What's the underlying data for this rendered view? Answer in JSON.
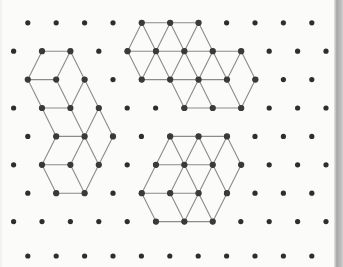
{
  "canvas": {
    "width": 343,
    "height": 267,
    "background_color": "#fbfbfa",
    "title": "isometric-cube-puzzle-dot-grid"
  },
  "grid": {
    "type": "triangular-dot-lattice",
    "dot_color": "#2e2e2e",
    "dot_radius": 2.6,
    "column_spacing": 28.4,
    "row_spacing": 28.4,
    "odd_row_offset": 14.2,
    "origin_x": 13.6,
    "origin_y": 22.8,
    "columns": 12,
    "rows": 9,
    "row_y_values": [
      22.8,
      51.2,
      79.6,
      108.0,
      136.4,
      164.8,
      193.2,
      221.6,
      256.0
    ],
    "row_offsets": [
      1,
      0,
      1,
      0,
      1,
      0,
      1,
      0,
      1
    ]
  },
  "style": {
    "line_color": "#8b8b8b",
    "line_width": 1.1,
    "vertex_color": "#3a3a3a",
    "vertex_radius": 3.1,
    "edge_strip_color": "#a8a8a8"
  },
  "chart_data": {
    "type": "scatter",
    "xlabel": "",
    "ylabel": "",
    "xlim": [
      0,
      343
    ],
    "ylim": [
      0,
      267
    ],
    "grid": true,
    "legend": "none",
    "shapes": [
      {
        "name": "left-cube-cluster",
        "label": "left shape",
        "vertices": [
          [
            42.0,
            51.2
          ],
          [
            70.4,
            51.2
          ],
          [
            27.8,
            79.6
          ],
          [
            56.2,
            79.6
          ],
          [
            84.6,
            79.6
          ],
          [
            42.0,
            108.0
          ],
          [
            70.4,
            108.0
          ],
          [
            98.8,
            108.0
          ],
          [
            56.2,
            136.4
          ],
          [
            84.6,
            136.4
          ],
          [
            113.0,
            136.4
          ],
          [
            42.0,
            164.8
          ],
          [
            70.4,
            164.8
          ],
          [
            98.8,
            164.8
          ],
          [
            56.2,
            193.2
          ],
          [
            84.6,
            193.2
          ]
        ],
        "edges": [
          [
            [
              42.0,
              51.2
            ],
            [
              70.4,
              51.2
            ]
          ],
          [
            [
              42.0,
              51.2
            ],
            [
              27.8,
              79.6
            ]
          ],
          [
            [
              70.4,
              51.2
            ],
            [
              56.2,
              79.6
            ]
          ],
          [
            [
              70.4,
              51.2
            ],
            [
              84.6,
              79.6
            ]
          ],
          [
            [
              27.8,
              79.6
            ],
            [
              56.2,
              79.6
            ]
          ],
          [
            [
              27.8,
              79.6
            ],
            [
              42.0,
              108.0
            ]
          ],
          [
            [
              56.2,
              79.6
            ],
            [
              70.4,
              108.0
            ]
          ],
          [
            [
              84.6,
              79.6
            ],
            [
              70.4,
              108.0
            ]
          ],
          [
            [
              84.6,
              79.6
            ],
            [
              98.8,
              108.0
            ]
          ],
          [
            [
              42.0,
              108.0
            ],
            [
              70.4,
              108.0
            ]
          ],
          [
            [
              42.0,
              108.0
            ],
            [
              56.2,
              136.4
            ]
          ],
          [
            [
              70.4,
              108.0
            ],
            [
              84.6,
              136.4
            ]
          ],
          [
            [
              98.8,
              108.0
            ],
            [
              84.6,
              136.4
            ]
          ],
          [
            [
              98.8,
              108.0
            ],
            [
              113.0,
              136.4
            ]
          ],
          [
            [
              56.2,
              136.4
            ],
            [
              84.6,
              136.4
            ]
          ],
          [
            [
              56.2,
              136.4
            ],
            [
              42.0,
              164.8
            ]
          ],
          [
            [
              84.6,
              136.4
            ],
            [
              70.4,
              164.8
            ]
          ],
          [
            [
              84.6,
              136.4
            ],
            [
              98.8,
              164.8
            ]
          ],
          [
            [
              113.0,
              136.4
            ],
            [
              98.8,
              164.8
            ]
          ],
          [
            [
              42.0,
              164.8
            ],
            [
              70.4,
              164.8
            ]
          ],
          [
            [
              42.0,
              164.8
            ],
            [
              56.2,
              193.2
            ]
          ],
          [
            [
              70.4,
              164.8
            ],
            [
              84.6,
              193.2
            ]
          ],
          [
            [
              98.8,
              164.8
            ],
            [
              84.6,
              193.2
            ]
          ],
          [
            [
              56.2,
              193.2
            ],
            [
              84.6,
              193.2
            ]
          ]
        ]
      },
      {
        "name": "top-right-cube-cluster",
        "label": "top middle shape",
        "vertices": [
          [
            141.8,
            22.8
          ],
          [
            170.2,
            22.8
          ],
          [
            198.6,
            22.8
          ],
          [
            127.6,
            51.2
          ],
          [
            156.0,
            51.2
          ],
          [
            184.4,
            51.2
          ],
          [
            212.8,
            51.2
          ],
          [
            241.2,
            51.2
          ],
          [
            141.8,
            79.6
          ],
          [
            170.2,
            79.6
          ],
          [
            198.6,
            79.6
          ],
          [
            227.0,
            79.6
          ],
          [
            255.4,
            79.6
          ],
          [
            184.4,
            108.0
          ],
          [
            212.8,
            108.0
          ],
          [
            241.2,
            108.0
          ]
        ],
        "edges": [
          [
            [
              141.8,
              22.8
            ],
            [
              170.2,
              22.8
            ]
          ],
          [
            [
              170.2,
              22.8
            ],
            [
              198.6,
              22.8
            ]
          ],
          [
            [
              141.8,
              22.8
            ],
            [
              127.6,
              51.2
            ]
          ],
          [
            [
              141.8,
              22.8
            ],
            [
              156.0,
              51.2
            ]
          ],
          [
            [
              170.2,
              22.8
            ],
            [
              156.0,
              51.2
            ]
          ],
          [
            [
              170.2,
              22.8
            ],
            [
              184.4,
              51.2
            ]
          ],
          [
            [
              198.6,
              22.8
            ],
            [
              184.4,
              51.2
            ]
          ],
          [
            [
              198.6,
              22.8
            ],
            [
              212.8,
              51.2
            ]
          ],
          [
            [
              127.6,
              51.2
            ],
            [
              156.0,
              51.2
            ]
          ],
          [
            [
              156.0,
              51.2
            ],
            [
              184.4,
              51.2
            ]
          ],
          [
            [
              184.4,
              51.2
            ],
            [
              212.8,
              51.2
            ]
          ],
          [
            [
              212.8,
              51.2
            ],
            [
              241.2,
              51.2
            ]
          ],
          [
            [
              127.6,
              51.2
            ],
            [
              141.8,
              79.6
            ]
          ],
          [
            [
              156.0,
              51.2
            ],
            [
              141.8,
              79.6
            ]
          ],
          [
            [
              156.0,
              51.2
            ],
            [
              170.2,
              79.6
            ]
          ],
          [
            [
              184.4,
              51.2
            ],
            [
              170.2,
              79.6
            ]
          ],
          [
            [
              184.4,
              51.2
            ],
            [
              198.6,
              79.6
            ]
          ],
          [
            [
              212.8,
              51.2
            ],
            [
              198.6,
              79.6
            ]
          ],
          [
            [
              212.8,
              51.2
            ],
            [
              227.0,
              79.6
            ]
          ],
          [
            [
              241.2,
              51.2
            ],
            [
              227.0,
              79.6
            ]
          ],
          [
            [
              241.2,
              51.2
            ],
            [
              255.4,
              79.6
            ]
          ],
          [
            [
              141.8,
              79.6
            ],
            [
              170.2,
              79.6
            ]
          ],
          [
            [
              170.2,
              79.6
            ],
            [
              198.6,
              79.6
            ]
          ],
          [
            [
              198.6,
              79.6
            ],
            [
              227.0,
              79.6
            ]
          ],
          [
            [
              170.2,
              79.6
            ],
            [
              184.4,
              108.0
            ]
          ],
          [
            [
              198.6,
              79.6
            ],
            [
              184.4,
              108.0
            ]
          ],
          [
            [
              198.6,
              79.6
            ],
            [
              212.8,
              108.0
            ]
          ],
          [
            [
              227.0,
              79.6
            ],
            [
              241.2,
              108.0
            ]
          ],
          [
            [
              255.4,
              79.6
            ],
            [
              241.2,
              108.0
            ]
          ],
          [
            [
              184.4,
              108.0
            ],
            [
              212.8,
              108.0
            ]
          ],
          [
            [
              212.8,
              108.0
            ],
            [
              241.2,
              108.0
            ]
          ]
        ]
      },
      {
        "name": "bottom-right-cube-cluster",
        "label": "bottom middle shape",
        "vertices": [
          [
            170.2,
            136.4
          ],
          [
            198.6,
            136.4
          ],
          [
            227.0,
            136.4
          ],
          [
            156.0,
            164.8
          ],
          [
            184.4,
            164.8
          ],
          [
            212.8,
            164.8
          ],
          [
            241.2,
            164.8
          ],
          [
            141.8,
            193.2
          ],
          [
            170.2,
            193.2
          ],
          [
            198.6,
            193.2
          ],
          [
            227.0,
            193.2
          ],
          [
            156.0,
            221.6
          ],
          [
            184.4,
            221.6
          ],
          [
            212.8,
            221.6
          ]
        ],
        "edges": [
          [
            [
              170.2,
              136.4
            ],
            [
              198.6,
              136.4
            ]
          ],
          [
            [
              198.6,
              136.4
            ],
            [
              227.0,
              136.4
            ]
          ],
          [
            [
              170.2,
              136.4
            ],
            [
              156.0,
              164.8
            ]
          ],
          [
            [
              170.2,
              136.4
            ],
            [
              184.4,
              164.8
            ]
          ],
          [
            [
              198.6,
              136.4
            ],
            [
              184.4,
              164.8
            ]
          ],
          [
            [
              198.6,
              136.4
            ],
            [
              212.8,
              164.8
            ]
          ],
          [
            [
              227.0,
              136.4
            ],
            [
              212.8,
              164.8
            ]
          ],
          [
            [
              227.0,
              136.4
            ],
            [
              241.2,
              164.8
            ]
          ],
          [
            [
              156.0,
              164.8
            ],
            [
              184.4,
              164.8
            ]
          ],
          [
            [
              184.4,
              164.8
            ],
            [
              212.8,
              164.8
            ]
          ],
          [
            [
              156.0,
              164.8
            ],
            [
              141.8,
              193.2
            ]
          ],
          [
            [
              184.4,
              164.8
            ],
            [
              170.2,
              193.2
            ]
          ],
          [
            [
              184.4,
              164.8
            ],
            [
              198.6,
              193.2
            ]
          ],
          [
            [
              212.8,
              164.8
            ],
            [
              198.6,
              193.2
            ]
          ],
          [
            [
              212.8,
              164.8
            ],
            [
              227.0,
              193.2
            ]
          ],
          [
            [
              241.2,
              164.8
            ],
            [
              227.0,
              193.2
            ]
          ],
          [
            [
              141.8,
              193.2
            ],
            [
              170.2,
              193.2
            ]
          ],
          [
            [
              170.2,
              193.2
            ],
            [
              198.6,
              193.2
            ]
          ],
          [
            [
              141.8,
              193.2
            ],
            [
              156.0,
              221.6
            ]
          ],
          [
            [
              170.2,
              193.2
            ],
            [
              184.4,
              221.6
            ]
          ],
          [
            [
              198.6,
              193.2
            ],
            [
              184.4,
              221.6
            ]
          ],
          [
            [
              198.6,
              193.2
            ],
            [
              212.8,
              221.6
            ]
          ],
          [
            [
              227.0,
              193.2
            ],
            [
              212.8,
              221.6
            ]
          ],
          [
            [
              156.0,
              221.6
            ],
            [
              184.4,
              221.6
            ]
          ],
          [
            [
              184.4,
              221.6
            ],
            [
              212.8,
              221.6
            ]
          ]
        ]
      }
    ]
  }
}
